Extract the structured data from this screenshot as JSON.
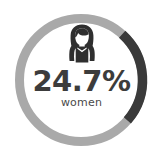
{
  "widget": {
    "name": "women-percentage-donut",
    "background": "#ffffff",
    "icon_name": "woman-icon",
    "value_text": "24.7%",
    "label_text": "women"
  },
  "chart_data": {
    "type": "pie",
    "subtype": "donut-gauge",
    "title": "",
    "subtitle": "",
    "xlabel": "",
    "ylabel": "",
    "categories": [
      "women",
      "remainder"
    ],
    "values": [
      24.7,
      75.3
    ],
    "unit": "%",
    "center_value": "24.7%",
    "center_label": "women",
    "colors": {
      "progress": "#3a3a3a",
      "track": "#a9a9a9",
      "value_text": "#3c3c3c",
      "label_text": "#4a4a4a",
      "icon": "#2f2f2f",
      "background": "#ffffff"
    },
    "geometry": {
      "center_x": 81,
      "center_y": 80,
      "outer_radius": 66,
      "ring_thickness": 9,
      "start_angle_deg": 42,
      "sweep_angle_deg": 89,
      "direction": "clockwise"
    },
    "legend": null,
    "grid": false,
    "annotations": [
      "24.7%",
      "women"
    ]
  }
}
